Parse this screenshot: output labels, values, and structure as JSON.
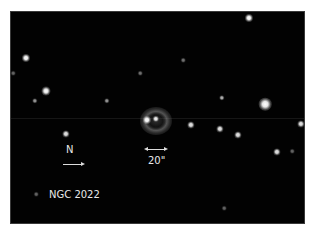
{
  "image": {
    "object_name": "NGC 2022",
    "orientation_label": "N",
    "scale_bar_label": "20\"",
    "colors": {
      "background": "#ffffff",
      "sky": "#020202",
      "text": "#e8e8e8"
    }
  },
  "stars": [
    {
      "x": 238,
      "y": 6,
      "size": 4.5,
      "brightness": 1.0
    },
    {
      "x": 15,
      "y": 46,
      "size": 4.5,
      "brightness": 1.0
    },
    {
      "x": 172,
      "y": 48,
      "size": 2.5,
      "brightness": 0.45
    },
    {
      "x": 129,
      "y": 61,
      "size": 2.5,
      "brightness": 0.45
    },
    {
      "x": 2,
      "y": 61,
      "size": 2.5,
      "brightness": 0.4
    },
    {
      "x": 35,
      "y": 79,
      "size": 5,
      "brightness": 1.0
    },
    {
      "x": 24,
      "y": 89,
      "size": 3,
      "brightness": 0.6
    },
    {
      "x": 96,
      "y": 89,
      "size": 3,
      "brightness": 0.6
    },
    {
      "x": 211,
      "y": 86,
      "size": 3,
      "brightness": 0.7
    },
    {
      "x": 254,
      "y": 92,
      "size": 7,
      "brightness": 1.0
    },
    {
      "x": 290,
      "y": 112,
      "size": 4,
      "brightness": 0.9
    },
    {
      "x": 180,
      "y": 113,
      "size": 4,
      "brightness": 0.9
    },
    {
      "x": 209,
      "y": 117,
      "size": 4,
      "brightness": 0.9
    },
    {
      "x": 227,
      "y": 123,
      "size": 4,
      "brightness": 0.9
    },
    {
      "x": 55,
      "y": 122,
      "size": 4,
      "brightness": 0.9
    },
    {
      "x": 266,
      "y": 140,
      "size": 4,
      "brightness": 0.9
    },
    {
      "x": 281,
      "y": 139,
      "size": 2.5,
      "brightness": 0.4
    },
    {
      "x": 25,
      "y": 182,
      "size": 2.5,
      "brightness": 0.4
    },
    {
      "x": 213,
      "y": 196,
      "size": 2.5,
      "brightness": 0.4
    },
    {
      "x": 136,
      "y": 108,
      "size": 4.5,
      "brightness": 1.0
    },
    {
      "x": 145,
      "y": 107,
      "size": 3.5,
      "brightness": 0.95
    }
  ]
}
